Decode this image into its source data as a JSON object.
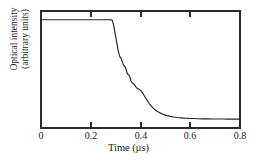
{
  "chart_data": {
    "type": "line",
    "title": "",
    "xlabel": "Time (μs)",
    "ylabel_line1": "Optical intensity",
    "ylabel_line2": "(arbitrary units)",
    "xlim": [
      0,
      0.8
    ],
    "ylim": [
      0,
      1
    ],
    "grid": false,
    "legend": "none",
    "line_color": "#262626",
    "frame_color": "#2b2b2b",
    "background_color": "#ffffff",
    "xticks": [
      0,
      0.2,
      0.4,
      0.6,
      0.8
    ],
    "xtick_labels": [
      "0",
      "0.2",
      "0.4",
      "0.6",
      "0.8"
    ],
    "yticks": [],
    "ytick_labels": [],
    "series": [
      {
        "name": "Optical intensity decay",
        "x": [
          0.0,
          0.02,
          0.04,
          0.06,
          0.08,
          0.1,
          0.12,
          0.14,
          0.16,
          0.18,
          0.2,
          0.22,
          0.24,
          0.26,
          0.275,
          0.283,
          0.287,
          0.292,
          0.297,
          0.302,
          0.307,
          0.311,
          0.315,
          0.318,
          0.322,
          0.325,
          0.329,
          0.332,
          0.336,
          0.339,
          0.342,
          0.345,
          0.348,
          0.352,
          0.355,
          0.358,
          0.361,
          0.364,
          0.368,
          0.372,
          0.376,
          0.38,
          0.384,
          0.388,
          0.392,
          0.397,
          0.402,
          0.408,
          0.414,
          0.42,
          0.428,
          0.436,
          0.444,
          0.452,
          0.462,
          0.472,
          0.482,
          0.494,
          0.506,
          0.52,
          0.534,
          0.548,
          0.562,
          0.578,
          0.594,
          0.612,
          0.63,
          0.65,
          0.67,
          0.69,
          0.71,
          0.73,
          0.75,
          0.77,
          0.785,
          0.8
        ],
        "y": [
          0.925,
          0.925,
          0.925,
          0.925,
          0.925,
          0.925,
          0.925,
          0.925,
          0.925,
          0.925,
          0.925,
          0.925,
          0.925,
          0.925,
          0.925,
          0.924,
          0.918,
          0.88,
          0.82,
          0.758,
          0.7,
          0.655,
          0.622,
          0.605,
          0.596,
          0.575,
          0.552,
          0.536,
          0.528,
          0.522,
          0.5,
          0.476,
          0.462,
          0.455,
          0.45,
          0.43,
          0.408,
          0.392,
          0.384,
          0.379,
          0.369,
          0.355,
          0.344,
          0.338,
          0.333,
          0.327,
          0.317,
          0.3,
          0.28,
          0.258,
          0.232,
          0.207,
          0.186,
          0.168,
          0.15,
          0.136,
          0.125,
          0.114,
          0.106,
          0.099,
          0.094,
          0.09,
          0.087,
          0.084,
          0.082,
          0.081,
          0.079,
          0.078,
          0.078,
          0.077,
          0.077,
          0.077,
          0.076,
          0.076,
          0.076,
          0.076
        ]
      }
    ],
    "annotations": []
  },
  "axes": {
    "x_title": "Time (μs)",
    "y_title_line1": "Optical intensity",
    "y_title_line2": "(arbitrary units)",
    "x_tick_labels": [
      "0",
      "0.2",
      "0.4",
      "0.6",
      "0.8"
    ]
  }
}
